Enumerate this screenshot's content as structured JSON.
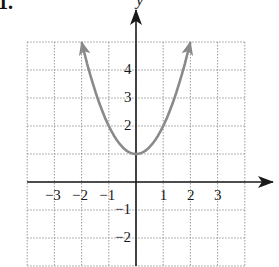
{
  "problem_number": "1.",
  "chart_data": {
    "type": "line",
    "title": "",
    "function": "y = x^2 + 1",
    "xlabel": "",
    "ylabel": "y",
    "xlim": [
      -4,
      4
    ],
    "ylim": [
      -3,
      5
    ],
    "grid": true,
    "grid_style": "dotted",
    "x_ticks": [
      "-3",
      "-2",
      "-1",
      "1",
      "2",
      "3"
    ],
    "y_ticks": [
      "4",
      "3",
      "2",
      "-1",
      "-2"
    ],
    "series": [
      {
        "name": "parabola",
        "color": "#8a8a8a",
        "x": [
          -2,
          -1.5,
          -1,
          -0.5,
          0,
          0.5,
          1,
          1.5,
          2
        ],
        "y": [
          5,
          3.25,
          2,
          1.25,
          1,
          1.25,
          2,
          3.25,
          5
        ],
        "arrows_at_ends": true
      }
    ],
    "vertex": [
      0,
      1
    ]
  },
  "colors": {
    "axis": "#1a1a1a",
    "grid": "#9a9a9a",
    "curve": "#8a8a8a"
  }
}
